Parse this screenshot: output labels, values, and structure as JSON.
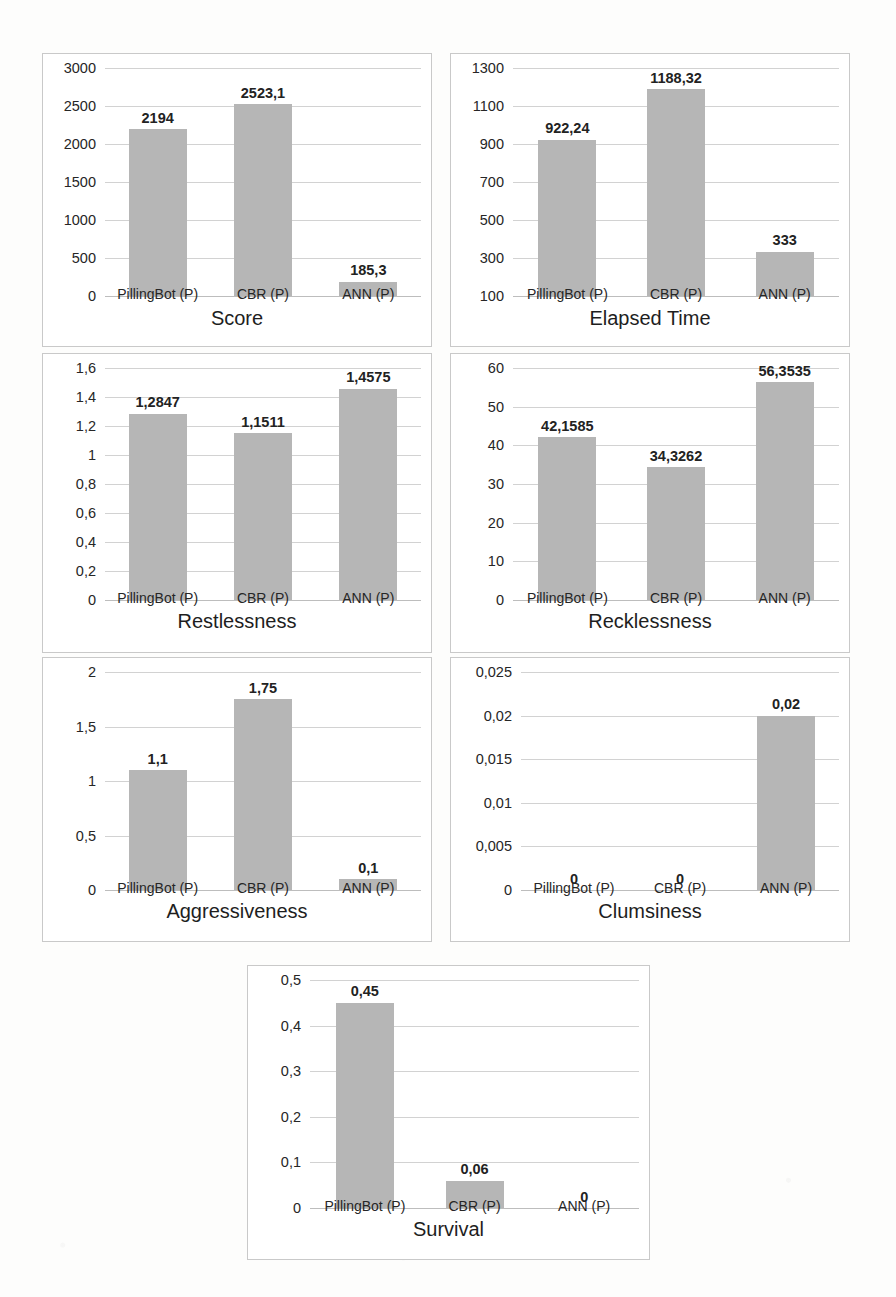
{
  "figure": {
    "categories": [
      "PillingBot (P)",
      "CBR (P)",
      "ANN (P)"
    ],
    "bar_color": "#b6b6b6",
    "gridline_color": "#d2d2d2",
    "panel_border_color": "#c9c9c9",
    "background_color": "#fdfdfc",
    "layout": "2 x 2 x 2 + 1 centered"
  },
  "charts": [
    {
      "id": "score",
      "title": "Score",
      "type": "bar",
      "categories": [
        "PillingBot (P)",
        "CBR (P)",
        "ANN (P)"
      ],
      "values": [
        2194,
        2523.1,
        185.3
      ],
      "labels": [
        "2194",
        "2523,1",
        "185,3"
      ],
      "yticks": [
        0,
        500,
        1000,
        1500,
        2000,
        2500,
        3000
      ],
      "ytick_labels": [
        "0",
        "500",
        "1000",
        "1500",
        "2000",
        "2500",
        "3000"
      ],
      "ylim": [
        0,
        3000
      ],
      "xlabel": "Score",
      "ylabel": "",
      "grid": true,
      "legend": "none"
    },
    {
      "id": "elapsed-time",
      "title": "Elapsed Time",
      "type": "bar",
      "categories": [
        "PillingBot (P)",
        "CBR (P)",
        "ANN (P)"
      ],
      "values": [
        922.24,
        1188.32,
        333
      ],
      "labels": [
        "922,24",
        "1188,32",
        "333"
      ],
      "yticks": [
        100,
        300,
        500,
        700,
        900,
        1100,
        1300
      ],
      "ytick_labels": [
        "100",
        "300",
        "500",
        "700",
        "900",
        "1100",
        "1300"
      ],
      "ylim": [
        100,
        1300
      ],
      "xlabel": "Elapsed Time",
      "ylabel": "",
      "grid": true,
      "legend": "none"
    },
    {
      "id": "restlessness",
      "title": "Restlessness",
      "type": "bar",
      "categories": [
        "PillingBot (P)",
        "CBR (P)",
        "ANN (P)"
      ],
      "values": [
        1.2847,
        1.1511,
        1.4575
      ],
      "labels": [
        "1,2847",
        "1,1511",
        "1,4575"
      ],
      "yticks": [
        0,
        0.2,
        0.4,
        0.6,
        0.8,
        1,
        1.2,
        1.4,
        1.6
      ],
      "ytick_labels": [
        "0",
        "0,2",
        "0,4",
        "0,6",
        "0,8",
        "1",
        "1,2",
        "1,4",
        "1,6"
      ],
      "ylim": [
        0,
        1.6
      ],
      "xlabel": "Restlessness",
      "ylabel": "",
      "grid": true,
      "legend": "none"
    },
    {
      "id": "recklessness",
      "title": "Recklessness",
      "type": "bar",
      "categories": [
        "PillingBot (P)",
        "CBR (P)",
        "ANN (P)"
      ],
      "values": [
        42.1585,
        34.3262,
        56.3535
      ],
      "labels": [
        "42,1585",
        "34,3262",
        "56,3535"
      ],
      "yticks": [
        0,
        10,
        20,
        30,
        40,
        50,
        60
      ],
      "ytick_labels": [
        "0",
        "10",
        "20",
        "30",
        "40",
        "50",
        "60"
      ],
      "ylim": [
        0,
        60
      ],
      "xlabel": "Recklessness",
      "ylabel": "",
      "grid": true,
      "legend": "none"
    },
    {
      "id": "aggressiveness",
      "title": "Aggressiveness",
      "type": "bar",
      "categories": [
        "PillingBot (P)",
        "CBR (P)",
        "ANN (P)"
      ],
      "values": [
        1.1,
        1.75,
        0.1
      ],
      "labels": [
        "1,1",
        "1,75",
        "0,1"
      ],
      "yticks": [
        0,
        0.5,
        1,
        1.5,
        2
      ],
      "ytick_labels": [
        "0",
        "0,5",
        "1",
        "1,5",
        "2"
      ],
      "ylim": [
        0,
        2
      ],
      "xlabel": "Aggressiveness",
      "ylabel": "",
      "grid": true,
      "legend": "none"
    },
    {
      "id": "clumsiness",
      "title": "Clumsiness",
      "type": "bar",
      "categories": [
        "PillingBot (P)",
        "CBR (P)",
        "ANN (P)"
      ],
      "values": [
        0,
        0,
        0.02
      ],
      "labels": [
        "0",
        "0",
        "0,02"
      ],
      "yticks": [
        0,
        0.005,
        0.01,
        0.015,
        0.02,
        0.025
      ],
      "ytick_labels": [
        "0",
        "0,005",
        "0,01",
        "0,015",
        "0,02",
        "0,025"
      ],
      "ylim": [
        0,
        0.025
      ],
      "xlabel": "Clumsiness",
      "ylabel": "",
      "grid": true,
      "legend": "none"
    },
    {
      "id": "survival",
      "title": "Survival",
      "type": "bar",
      "categories": [
        "PillingBot (P)",
        "CBR (P)",
        "ANN (P)"
      ],
      "values": [
        0.45,
        0.06,
        0
      ],
      "labels": [
        "0,45",
        "0,06",
        "0"
      ],
      "yticks": [
        0,
        0.1,
        0.2,
        0.3,
        0.4,
        0.5
      ],
      "ytick_labels": [
        "0",
        "0,1",
        "0,2",
        "0,3",
        "0,4",
        "0,5"
      ],
      "ylim": [
        0,
        0.5
      ],
      "xlabel": "Survival",
      "ylabel": "",
      "grid": true,
      "legend": "none"
    }
  ],
  "chart_data": {
    "type": "bar",
    "title": "",
    "panels": [
      {
        "title": "Score",
        "categories": [
          "PillingBot (P)",
          "CBR (P)",
          "ANN (P)"
        ],
        "values": [
          2194,
          2523.1,
          185.3
        ],
        "ylim": [
          0,
          3000
        ],
        "ylabel": "",
        "xlabel": "Score"
      },
      {
        "title": "Elapsed Time",
        "categories": [
          "PillingBot (P)",
          "CBR (P)",
          "ANN (P)"
        ],
        "values": [
          922.24,
          1188.32,
          333
        ],
        "ylim": [
          100,
          1300
        ],
        "ylabel": "",
        "xlabel": "Elapsed Time"
      },
      {
        "title": "Restlessness",
        "categories": [
          "PillingBot (P)",
          "CBR (P)",
          "ANN (P)"
        ],
        "values": [
          1.2847,
          1.1511,
          1.4575
        ],
        "ylim": [
          0,
          1.6
        ],
        "ylabel": "",
        "xlabel": "Restlessness"
      },
      {
        "title": "Recklessness",
        "categories": [
          "PillingBot (P)",
          "CBR (P)",
          "ANN (P)"
        ],
        "values": [
          42.1585,
          34.3262,
          56.3535
        ],
        "ylim": [
          0,
          60
        ],
        "ylabel": "",
        "xlabel": "Recklessness"
      },
      {
        "title": "Aggressiveness",
        "categories": [
          "PillingBot (P)",
          "CBR (P)",
          "ANN (P)"
        ],
        "values": [
          1.1,
          1.75,
          0.1
        ],
        "ylim": [
          0,
          2
        ],
        "ylabel": "",
        "xlabel": "Aggressiveness"
      },
      {
        "title": "Clumsiness",
        "categories": [
          "PillingBot (P)",
          "CBR (P)",
          "ANN (P)"
        ],
        "values": [
          0,
          0,
          0.02
        ],
        "ylim": [
          0,
          0.025
        ],
        "ylabel": "",
        "xlabel": "Clumsiness"
      },
      {
        "title": "Survival",
        "categories": [
          "PillingBot (P)",
          "CBR (P)",
          "ANN (P)"
        ],
        "values": [
          0.45,
          0.06,
          0
        ],
        "ylim": [
          0,
          0.5
        ],
        "ylabel": "",
        "xlabel": "Survival"
      }
    ],
    "grid": true,
    "legend": "none",
    "series_color": "#b6b6b6"
  }
}
